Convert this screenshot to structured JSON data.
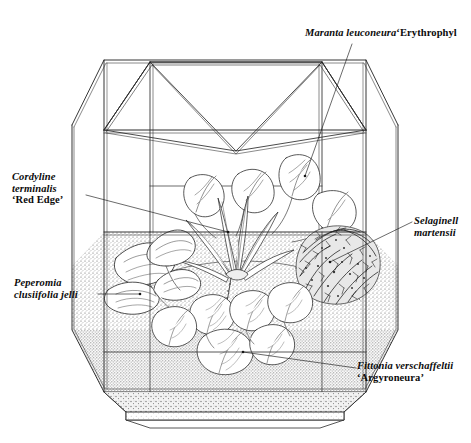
{
  "figure": {
    "medium": "pen-and-ink line illustration with stipple shading",
    "background_color": "#ffffff",
    "ink_color": "#111111"
  },
  "labels": [
    {
      "id": "maranta",
      "name": "maranta-label",
      "lines": [
        {
          "sci": "Maranta leuconeura",
          "cv": "‘Erythrophyl"
        }
      ],
      "clipped_at_right_edge": true,
      "leader_from": [
        352,
        44
      ],
      "leader_to": [
        305,
        176
      ]
    },
    {
      "id": "cordyline",
      "name": "cordyline-label",
      "lines": [
        {
          "sci": "Cordyline",
          "cv": ""
        },
        {
          "sci": "terminalis",
          "cv": ""
        },
        {
          "sci": "",
          "cv": "‘Red Edge’"
        }
      ],
      "clipped_at_right_edge": false,
      "leader_from": [
        86,
        195
      ],
      "leader_to": [
        228,
        232
      ]
    },
    {
      "id": "selaginella",
      "name": "selaginella-label",
      "lines": [
        {
          "sci": "Selaginell",
          "cv": ""
        },
        {
          "sci": "martensii",
          "cv": ""
        }
      ],
      "clipped_at_right_edge": true,
      "leader_from": [
        412,
        222
      ],
      "leader_to": [
        330,
        262
      ]
    },
    {
      "id": "peperomia",
      "name": "peperomia-label",
      "lines": [
        {
          "sci": "Peperomia",
          "cv": ""
        },
        {
          "sci": "clusiifolia jelli",
          "cv": ""
        }
      ],
      "clipped_at_right_edge": false,
      "leader_from": [
        98,
        294
      ],
      "leader_to": [
        140,
        294
      ]
    },
    {
      "id": "fittonia",
      "name": "fittonia-label",
      "lines": [
        {
          "sci": "Fittonia verschaffeltii",
          "cv": ""
        },
        {
          "sci": "",
          "cv": "‘Argyroneura’"
        }
      ],
      "clipped_at_right_edge": false,
      "leader_from": [
        356,
        368
      ],
      "leader_to": [
        243,
        352
      ]
    }
  ],
  "plants": [
    {
      "name": "maranta-leuconeura-erythrophylla",
      "common_position": "upper centre-right, broad ribbed leaves"
    },
    {
      "name": "cordyline-terminalis-red-edge",
      "common_position": "centre, strap-shaped lance leaves"
    },
    {
      "name": "selaginella-martensii",
      "common_position": "right, dense dark feathery mound"
    },
    {
      "name": "peperomia-clusiifolia-jelli",
      "common_position": "left, thick pointed oval leaves"
    },
    {
      "name": "fittonia-verschaffeltii-argyroneura",
      "common_position": "foreground, rounded net-veined leaves"
    }
  ],
  "terrarium": {
    "shape": "octagonal glazed case",
    "roof": "eight-panel faceted roof meeting at a central apex",
    "frame": "double-line glazing bars",
    "base": "octagonal tray with stippled soil and gravel layers"
  }
}
